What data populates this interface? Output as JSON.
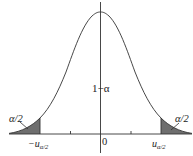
{
  "diagram": {
    "center_label": "1−α",
    "left_tail_label": "α/2",
    "right_tail_label": "α/2",
    "x_axis_labels": {
      "left_critical": "−u",
      "left_critical_sub": "α/2",
      "origin": "0",
      "right_critical": "u",
      "right_critical_sub": "α/2"
    },
    "colors": {
      "curve": "#333333",
      "axis": "#333333",
      "tail_fill": "#6e6e6e",
      "background": "#ffffff"
    }
  }
}
